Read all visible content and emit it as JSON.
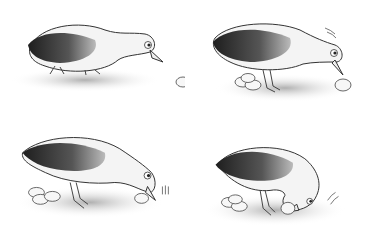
{
  "illustration": {
    "style": "grayscale cartoon",
    "layout": "2x2 sequence",
    "colors": {
      "background": "#ffffff",
      "outline": "#333333",
      "body": "#f4f4f4",
      "wing_dark": "#2a2a2a",
      "wing_mid": "#777777",
      "ground_shadow": "#bdbdbd",
      "egg": "#f7f7f7"
    },
    "panels": [
      {
        "id": 1,
        "scene": "bird looking at a single egg ahead",
        "eggs_in_pile": 0,
        "loose_egg": true,
        "motion_lines": false
      },
      {
        "id": 2,
        "scene": "bird standing over egg near pile of eggs",
        "eggs_in_pile": 3,
        "loose_egg": true,
        "motion_lines": true
      },
      {
        "id": 3,
        "scene": "bird bending to nudge egg with beak",
        "eggs_in_pile": 3,
        "loose_egg": true,
        "motion_lines": true
      },
      {
        "id": 4,
        "scene": "bird tucking head under to roll egg",
        "eggs_in_pile": 3,
        "loose_egg": true,
        "motion_lines": true
      }
    ]
  }
}
